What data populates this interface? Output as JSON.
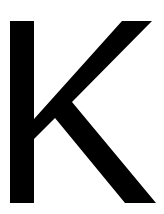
{
  "glyph": {
    "character": "K",
    "color": "#000000",
    "background": "#ffffff"
  }
}
